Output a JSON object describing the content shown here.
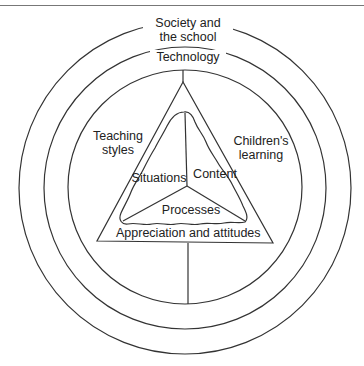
{
  "diagram": {
    "outer_ring": {
      "label_line1": "Society and",
      "label_line2": "the school"
    },
    "middle_ring": {
      "label": "Technology"
    },
    "inner_ring": {
      "left_label_line1": "Teaching",
      "left_label_line2": "styles",
      "right_label_line1": "Children's",
      "right_label_line2": "learning"
    },
    "triangle": {
      "base_label": "Appreciation and attitudes",
      "inner_sections": {
        "left": "Situations",
        "right": "Content",
        "bottom": "Processes"
      }
    },
    "colors": {
      "line": "#333333",
      "background": "#ffffff",
      "text": "#222222"
    }
  }
}
